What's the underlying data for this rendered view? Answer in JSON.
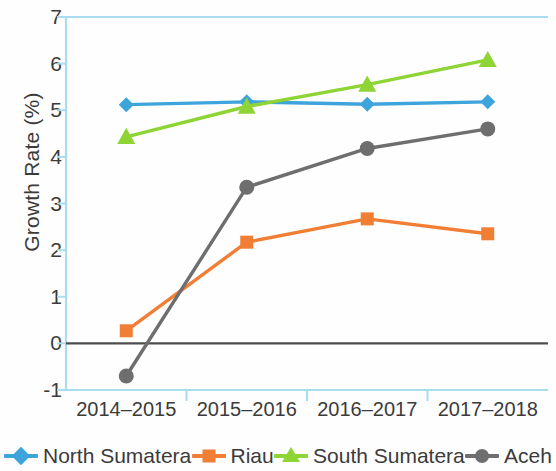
{
  "chart_data": {
    "type": "line",
    "title": "",
    "xlabel": "",
    "ylabel": "Growth Rate (%)",
    "categories": [
      "2014–2015",
      "2015–2016",
      "2016–2017",
      "2017–2018"
    ],
    "ylim": [
      -1,
      7
    ],
    "yticks": [
      -1,
      0,
      1,
      2,
      3,
      4,
      5,
      6,
      7
    ],
    "ytick_labels": [
      "-1",
      "0",
      "1",
      "2",
      "3",
      "4",
      "5",
      "6",
      "7"
    ],
    "grid": false,
    "legend_position": "bottom",
    "zero_line": true,
    "series": [
      {
        "name": "North Sumatera",
        "color": "#3da5dc",
        "marker": "diamond",
        "values": [
          5.12,
          5.18,
          5.13,
          5.18
        ]
      },
      {
        "name": "Riau",
        "color": "#f07f35",
        "marker": "square",
        "values": [
          0.27,
          2.17,
          2.67,
          2.35
        ]
      },
      {
        "name": "South Sumatera",
        "color": "#8dd434",
        "marker": "triangle",
        "values": [
          4.43,
          5.08,
          5.55,
          6.08
        ]
      },
      {
        "name": "Aceh",
        "color": "#6e6e6e",
        "marker": "circle",
        "values": [
          -0.7,
          3.35,
          4.18,
          4.6
        ]
      }
    ]
  },
  "axis": {
    "frame_color": "#a8dcef",
    "zero_line_color": "#4d4d4d",
    "tick_color": "#a8dcef",
    "text_color": "#3b3b3b"
  }
}
